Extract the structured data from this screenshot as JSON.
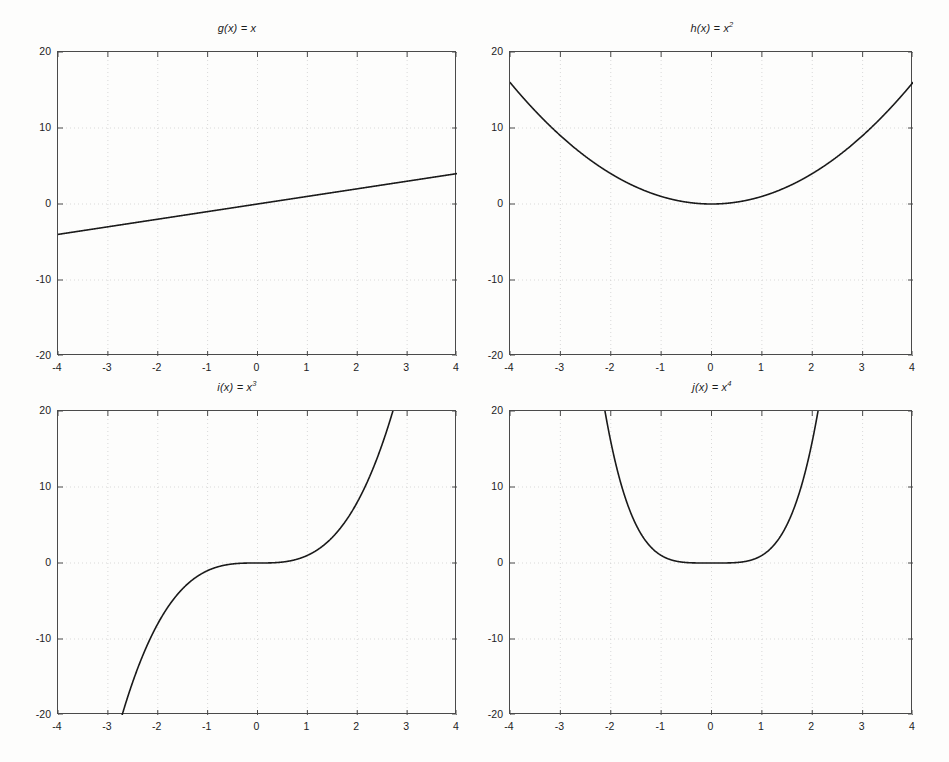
{
  "figure": {
    "width": 949,
    "height": 762,
    "background_color": "#fdfdfc",
    "axis_color": "#4a4a4a",
    "grid_color": "#c8c8c8",
    "curve_color": "#1a1a1a",
    "rows": 2,
    "cols": 2
  },
  "chart_data": [
    {
      "type": "line",
      "id": "g",
      "title": "g(x) = x",
      "title_base": "g(x) = x",
      "title_exponent": "",
      "expression": "x",
      "xlabel": "",
      "ylabel": "",
      "xlim": [
        -4,
        4
      ],
      "ylim": [
        -20,
        20
      ],
      "xticks": [
        -4,
        -3,
        -2,
        -1,
        0,
        1,
        2,
        3,
        4
      ],
      "yticks": [
        -20,
        -10,
        0,
        10,
        20
      ],
      "xticklabels": [
        "-4",
        "-3",
        "-2",
        "-1",
        "0",
        "1",
        "2",
        "3",
        "4"
      ],
      "yticklabels": [
        "-20",
        "-10",
        "0",
        "10",
        "20"
      ],
      "grid": true,
      "legend": "none",
      "x": [
        -4,
        -3.5,
        -3,
        -2.5,
        -2,
        -1.5,
        -1,
        -0.5,
        0,
        0.5,
        1,
        1.5,
        2,
        2.5,
        3,
        3.5,
        4
      ],
      "values": [
        -4,
        -3.5,
        -3,
        -2.5,
        -2,
        -1.5,
        -1,
        -0.5,
        0,
        0.5,
        1,
        1.5,
        2,
        2.5,
        3,
        3.5,
        4
      ]
    },
    {
      "type": "line",
      "id": "h",
      "title": "h(x) = x2",
      "title_base": "h(x) = x",
      "title_exponent": "2",
      "expression": "x^2",
      "xlabel": "",
      "ylabel": "",
      "xlim": [
        -4,
        4
      ],
      "ylim": [
        -20,
        20
      ],
      "xticks": [
        -4,
        -3,
        -2,
        -1,
        0,
        1,
        2,
        3,
        4
      ],
      "yticks": [
        -20,
        -10,
        0,
        10,
        20
      ],
      "xticklabels": [
        "-4",
        "-3",
        "-2",
        "-1",
        "0",
        "1",
        "2",
        "3",
        "4"
      ],
      "yticklabels": [
        "-20",
        "-10",
        "0",
        "10",
        "20"
      ],
      "grid": true,
      "legend": "none",
      "x": [
        -4,
        -3.5,
        -3,
        -2.5,
        -2,
        -1.5,
        -1,
        -0.5,
        0,
        0.5,
        1,
        1.5,
        2,
        2.5,
        3,
        3.5,
        4
      ],
      "values": [
        16,
        12.25,
        9,
        6.25,
        4,
        2.25,
        1,
        0.25,
        0,
        0.25,
        1,
        2.25,
        4,
        6.25,
        9,
        12.25,
        16
      ]
    },
    {
      "type": "line",
      "id": "i",
      "title": "i(x) = x3",
      "title_base": "i(x) = x",
      "title_exponent": "3",
      "expression": "x^3",
      "xlabel": "",
      "ylabel": "",
      "xlim": [
        -4,
        4
      ],
      "ylim": [
        -20,
        20
      ],
      "xticks": [
        -4,
        -3,
        -2,
        -1,
        0,
        1,
        2,
        3,
        4
      ],
      "yticks": [
        -20,
        -10,
        0,
        10,
        20
      ],
      "xticklabels": [
        "-4",
        "-3",
        "-2",
        "-1",
        "0",
        "1",
        "2",
        "3",
        "4"
      ],
      "yticklabels": [
        "-20",
        "-10",
        "0",
        "10",
        "20"
      ],
      "grid": true,
      "legend": "none",
      "clipped_at": [
        -2.714,
        2.714
      ],
      "x": [
        -4,
        -3.5,
        -3,
        -2.5,
        -2,
        -1.5,
        -1,
        -0.5,
        0,
        0.5,
        1,
        1.5,
        2,
        2.5,
        3,
        3.5,
        4
      ],
      "values": [
        -64,
        -42.875,
        -27,
        -15.625,
        -8,
        -3.375,
        -1,
        -0.125,
        0,
        0.125,
        1,
        3.375,
        8,
        15.625,
        27,
        42.875,
        64
      ]
    },
    {
      "type": "line",
      "id": "j",
      "title": "j(x) = x4",
      "title_base": "j(x) = x",
      "title_exponent": "4",
      "expression": "x^4",
      "xlabel": "",
      "ylabel": "",
      "xlim": [
        -4,
        4
      ],
      "ylim": [
        -20,
        20
      ],
      "xticks": [
        -4,
        -3,
        -2,
        -1,
        0,
        1,
        2,
        3,
        4
      ],
      "yticks": [
        -20,
        -10,
        0,
        10,
        20
      ],
      "xticklabels": [
        "-4",
        "-3",
        "-2",
        "-1",
        "0",
        "1",
        "2",
        "3",
        "4"
      ],
      "yticklabels": [
        "-20",
        "-10",
        "0",
        "10",
        "20"
      ],
      "grid": true,
      "legend": "none",
      "clipped_at": [
        -2.115,
        2.115
      ],
      "x": [
        -4,
        -3.5,
        -3,
        -2.5,
        -2,
        -1.5,
        -1,
        -0.5,
        0,
        0.5,
        1,
        1.5,
        2,
        2.5,
        3,
        3.5,
        4
      ],
      "values": [
        256,
        150.0625,
        81,
        39.0625,
        16,
        5.0625,
        1,
        0.0625,
        0,
        0.0625,
        1,
        5.0625,
        16,
        39.0625,
        81,
        150.0625,
        256
      ]
    }
  ]
}
